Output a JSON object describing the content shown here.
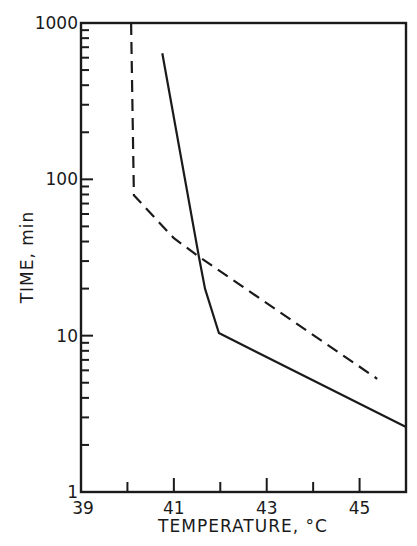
{
  "chart_data": {
    "type": "line",
    "title": "",
    "xlabel": "TEMPERATURE, °C",
    "ylabel": "TIME, min",
    "xlim": [
      39,
      46
    ],
    "ylim": [
      1,
      1000
    ],
    "yscale": "log",
    "x_ticks": [
      39,
      40,
      41,
      42,
      43,
      44,
      45,
      46
    ],
    "x_tick_labels": [
      "39",
      "41",
      "43",
      "45"
    ],
    "x_tick_label_values": [
      39,
      41,
      43,
      45
    ],
    "y_tick_labels": [
      "1",
      "10",
      "100",
      "1000"
    ],
    "y_tick_label_values": [
      1,
      10,
      100,
      1000
    ],
    "grid": false,
    "legend": null,
    "series": [
      {
        "name": "dashed",
        "style": "dashed",
        "color": "#1a1a1a",
        "x": [
          40.08,
          40.14,
          41.0,
          41.54,
          45.38
        ],
        "y": [
          1000,
          79,
          42,
          32,
          5.3
        ]
      },
      {
        "name": "solid",
        "style": "solid",
        "color": "#1a1a1a",
        "x": [
          40.75,
          41.54,
          41.67,
          41.97,
          46.0
        ],
        "y": [
          640,
          32,
          20,
          10.4,
          2.6
        ]
      }
    ]
  }
}
